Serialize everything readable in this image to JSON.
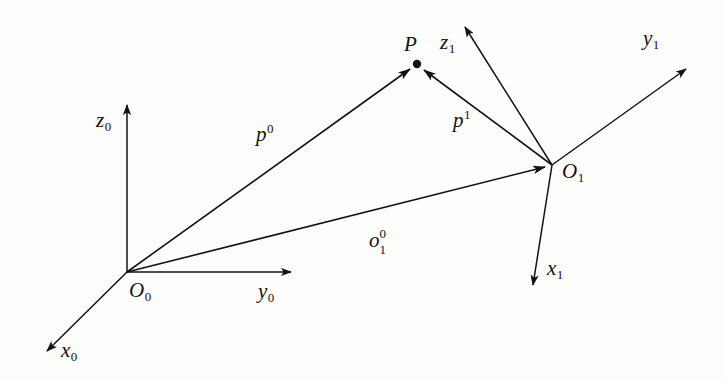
{
  "figure": {
    "background_color": "#fdfdfc",
    "ink_color": "#121212"
  },
  "frames": {
    "frame0": {
      "origin_label": {
        "base": "O",
        "sub": "0"
      },
      "axes": [
        {
          "name": "x0",
          "base": "x",
          "sub": "0"
        },
        {
          "name": "y0",
          "base": "y",
          "sub": "0"
        },
        {
          "name": "z0",
          "base": "z",
          "sub": "0"
        }
      ]
    },
    "frame1": {
      "origin_label": {
        "base": "O",
        "sub": "1"
      },
      "axes": [
        {
          "name": "x1",
          "base": "x",
          "sub": "1"
        },
        {
          "name": "y1",
          "base": "y",
          "sub": "1"
        },
        {
          "name": "z1",
          "base": "z",
          "sub": "1"
        }
      ]
    }
  },
  "point": {
    "label": "P"
  },
  "vectors": [
    {
      "name": "p0",
      "base": "p",
      "sup": "0",
      "from": "O0",
      "to": "P"
    },
    {
      "name": "p1",
      "base": "p",
      "sup": "1",
      "from": "O1",
      "to": "P"
    },
    {
      "name": "o10",
      "base": "o",
      "sup": "0",
      "sub": "1",
      "from": "O0",
      "to": "O1"
    }
  ],
  "geometry": {
    "O0": {
      "x": 127,
      "y": 272
    },
    "O1": {
      "x": 552,
      "y": 165
    },
    "P": {
      "x": 417,
      "y": 64
    },
    "x0_tip": {
      "x": 42,
      "y": 356
    },
    "y0_tip": {
      "x": 296,
      "y": 272
    },
    "z0_tip": {
      "x": 127,
      "y": 99
    },
    "x1_tip": {
      "x": 534,
      "y": 291
    },
    "y1_tip": {
      "x": 691,
      "y": 64
    },
    "z1_tip": {
      "x": 461,
      "y": 21
    }
  },
  "labels": {
    "x0": {
      "x": 61,
      "y": 340
    },
    "y0": {
      "x": 258,
      "y": 281
    },
    "z0": {
      "x": 96,
      "y": 110
    },
    "O0": {
      "x": 129,
      "y": 280
    },
    "x1": {
      "x": 547,
      "y": 258
    },
    "y1": {
      "x": 643,
      "y": 28
    },
    "z1": {
      "x": 440,
      "y": 32
    },
    "O1": {
      "x": 562,
      "y": 161
    },
    "P": {
      "x": 404,
      "y": 34
    },
    "p0": {
      "x": 256,
      "y": 122
    },
    "p1": {
      "x": 453,
      "y": 108
    },
    "o10": {
      "x": 369,
      "y": 230
    }
  }
}
